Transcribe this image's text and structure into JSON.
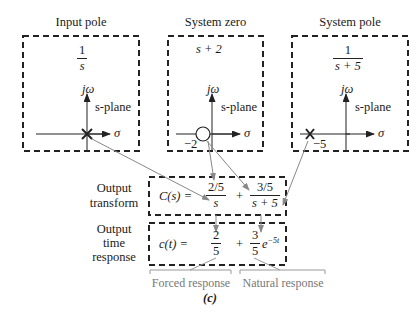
{
  "panels": [
    {
      "title": "Input pole",
      "expr_num": "1",
      "expr_den": "s",
      "plane_label": "s-plane",
      "jw": "jω",
      "sigma": "σ",
      "marker": "x",
      "marker_pos_label": ""
    },
    {
      "title": "System zero",
      "expr": "s + 2",
      "plane_label": "s-plane",
      "jw": "jω",
      "sigma": "σ",
      "marker": "o",
      "marker_pos_label": "−2"
    },
    {
      "title": "System pole",
      "expr_num": "1",
      "expr_den": "s + 5",
      "plane_label": "s-plane",
      "jw": "jω",
      "sigma": "σ",
      "marker": "x",
      "marker_pos_label": "−5"
    }
  ],
  "transform": {
    "label_line1": "Output",
    "label_line2": "transform",
    "lhs": "C(s) =",
    "term1_num": "2/5",
    "term1_den": "s",
    "plus": "+",
    "term2_num": "3/5",
    "term2_den": "s + 5"
  },
  "time_response": {
    "label_line1": "Output",
    "label_line2": "time",
    "label_line3": "response",
    "lhs": "c(t) =",
    "term1_num": "2",
    "term1_den": "5",
    "plus": "+",
    "term2_num": "3",
    "term2_den": "5",
    "term2_exp": "e",
    "term2_exp_sup": "−5t"
  },
  "brackets": {
    "forced": "Forced response",
    "natural": "Natural response"
  },
  "caption": "(c)",
  "colors": {
    "line": "#222222",
    "arrow": "#888888",
    "bracket": "#999999"
  }
}
